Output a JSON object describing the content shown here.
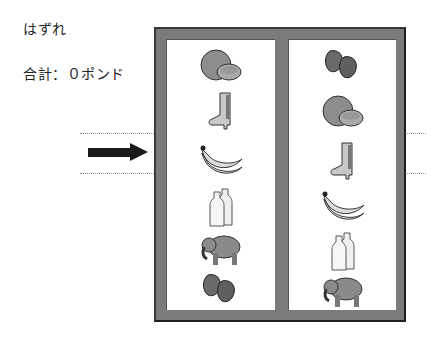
{
  "status": {
    "result_text": "はずれ",
    "total_text": "合計：０ポンド"
  },
  "colors": {
    "frame": "#7b7b7b",
    "frame_shadow": "#1e1e1e",
    "reel_bg": "#ffffff",
    "arrow": "#1a1a1a",
    "payline": "#8a8a8a"
  },
  "reels": [
    {
      "name": "left",
      "symbols": [
        "orange",
        "boot",
        "banana",
        "milk-bottles",
        "elephant",
        "strawberries"
      ]
    },
    {
      "name": "right",
      "symbols": [
        "strawberries",
        "orange",
        "boot",
        "banana",
        "milk-bottles",
        "elephant"
      ]
    }
  ],
  "payline": {
    "row_index": 2,
    "arrow": "right-arrow"
  }
}
